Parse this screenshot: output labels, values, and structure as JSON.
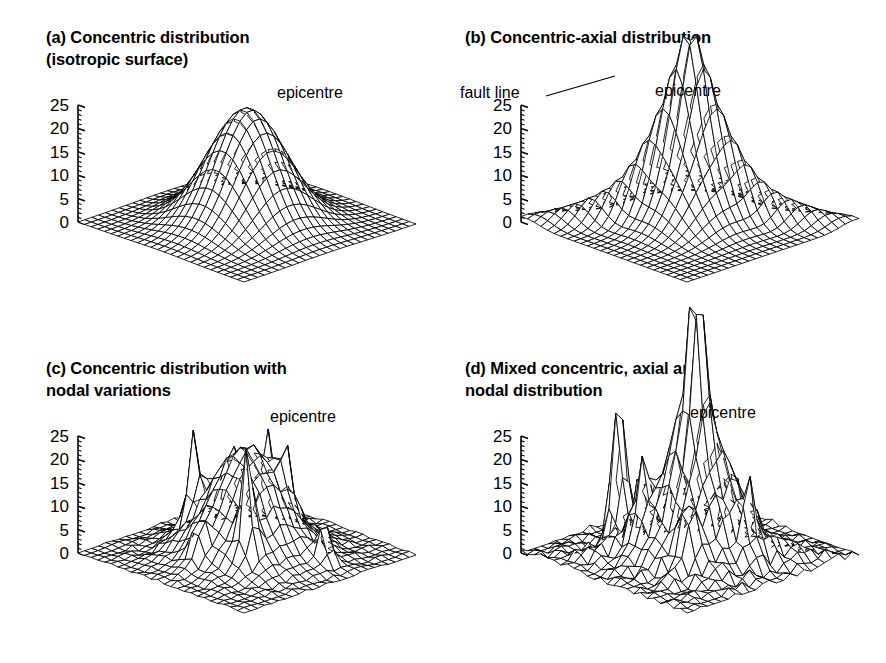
{
  "figure": {
    "background": "#ffffff",
    "ink": "#000000",
    "kind": "four-panel 3d wireframe surface figure"
  },
  "chart_data": {
    "type": "surface",
    "title": "",
    "shared": {
      "zlabel": "",
      "xlabel": "",
      "ylabel": "",
      "zticks": [
        0,
        5,
        10,
        15,
        20,
        25
      ],
      "ztick_labels": [
        "0",
        "5",
        "10",
        "15",
        "20",
        "25"
      ],
      "zlim": [
        0,
        25
      ],
      "minor_ticks_per_major": 5,
      "grid": "wireframe mesh",
      "grid_n": 26,
      "projection": "axonometric (rotated diamond base)",
      "legend": "none",
      "line_color": "#000000"
    },
    "panels": [
      {
        "id": "a",
        "tag": "(a)",
        "title": "(a) Concentric distribution\n      (isotropic surface)",
        "annotations": [
          {
            "name": "epicentre",
            "text": "epicentre",
            "x": 277,
            "y": 84,
            "leader": false
          }
        ],
        "surface": {
          "description": "single smooth isotropic gaussian dome centred on grid",
          "base_amplitude": 24.5,
          "peaks": [
            {
              "cx": 0.5,
              "cy": 0.5,
              "amp": 24.5,
              "sx": 0.165,
              "sy": 0.165,
              "shape": "gaussian"
            }
          ],
          "ridges": [],
          "spikes": [],
          "noise": 0.0
        }
      },
      {
        "id": "b",
        "tag": "(b)",
        "title": "(b) Concentric-axial distribution",
        "annotations": [
          {
            "name": "fault-line",
            "text": "fault line",
            "x": 17,
            "y": 84,
            "leader": true,
            "leader_from": [
              103,
              96
            ],
            "leader_to": [
              172,
              76
            ]
          },
          {
            "name": "epicentre",
            "text": "epicentre",
            "x": 212,
            "y": 82,
            "leader": false
          }
        ],
        "surface": {
          "description": "sharp concentric peak elongated along a diagonal fault axis",
          "base_amplitude": 24.5,
          "peaks": [
            {
              "cx": 0.5,
              "cy": 0.5,
              "amp": 21.0,
              "sx": 0.135,
              "sy": 0.135,
              "shape": "gaussian"
            },
            {
              "cx": 0.5,
              "cy": 0.5,
              "amp": 9.0,
              "sx": 0.055,
              "sy": 0.055,
              "shape": "gaussian"
            }
          ],
          "ridges": [
            {
              "angle_deg": 45,
              "amp": 11.5,
              "width": 0.055,
              "length": 0.33
            }
          ],
          "spikes": [],
          "noise": 0.0
        }
      },
      {
        "id": "c",
        "tag": "(c)",
        "title": "(c) Concentric distribution with\n      nodal variations",
        "annotations": [
          {
            "name": "epicentre",
            "text": "epicentre",
            "x": 270,
            "y": 408,
            "leader": false
          }
        ],
        "surface": {
          "description": "main concentric dome with isolated sharp nodal spikes scattered around it",
          "base_amplitude": 24.5,
          "peaks": [
            {
              "cx": 0.5,
              "cy": 0.5,
              "amp": 23.0,
              "sx": 0.16,
              "sy": 0.16,
              "shape": "gaussian"
            }
          ],
          "ridges": [],
          "spikes": [
            {
              "cx": 0.28,
              "cy": 0.4,
              "amp": 13.0,
              "s": 0.032
            },
            {
              "cx": 0.68,
              "cy": 0.33,
              "amp": 17.0,
              "s": 0.028
            },
            {
              "cx": 0.4,
              "cy": 0.72,
              "amp": 11.0,
              "s": 0.03
            },
            {
              "cx": 0.59,
              "cy": 0.63,
              "amp": 9.0,
              "s": 0.028
            },
            {
              "cx": 0.84,
              "cy": 0.62,
              "amp": 7.5,
              "s": 0.03
            },
            {
              "cx": 0.5,
              "cy": 0.22,
              "amp": 6.0,
              "s": 0.028
            },
            {
              "cx": 0.34,
              "cy": 0.56,
              "amp": 7.0,
              "s": 0.026
            }
          ],
          "noise": 0.35
        }
      },
      {
        "id": "d",
        "tag": "(d)",
        "title": "(d) Mixed concentric, axial and\n      nodal distribution",
        "annotations": [
          {
            "name": "epicentre",
            "text": "epicentre",
            "x": 247,
            "y": 404,
            "leader": false
          }
        ],
        "surface": {
          "description": "concentric dome plus axial ridge plus many tall nodal spikes, most irregular case",
          "base_amplitude": 27.0,
          "peaks": [
            {
              "cx": 0.58,
              "cy": 0.46,
              "amp": 21.0,
              "sx": 0.145,
              "sy": 0.145,
              "shape": "gaussian"
            }
          ],
          "ridges": [
            {
              "angle_deg": 45,
              "amp": 8.0,
              "width": 0.06,
              "length": 0.3,
              "cx": 0.58,
              "cy": 0.46
            }
          ],
          "spikes": [
            {
              "cx": 0.24,
              "cy": 0.34,
              "amp": 27.0,
              "s": 0.036
            },
            {
              "cx": 0.14,
              "cy": 0.58,
              "amp": 13.0,
              "s": 0.03
            },
            {
              "cx": 0.37,
              "cy": 0.56,
              "amp": 12.0,
              "s": 0.032
            },
            {
              "cx": 0.58,
              "cy": 0.46,
              "amp": 26.0,
              "s": 0.042
            },
            {
              "cx": 0.55,
              "cy": 0.7,
              "amp": 11.0,
              "s": 0.034
            },
            {
              "cx": 0.8,
              "cy": 0.55,
              "amp": 10.0,
              "s": 0.032
            },
            {
              "cx": 0.44,
              "cy": 0.28,
              "amp": 9.0,
              "s": 0.03
            },
            {
              "cx": 0.7,
              "cy": 0.3,
              "amp": 8.0,
              "s": 0.028
            },
            {
              "cx": 0.3,
              "cy": 0.74,
              "amp": 7.0,
              "s": 0.03
            }
          ],
          "noise": 0.9
        }
      }
    ]
  }
}
